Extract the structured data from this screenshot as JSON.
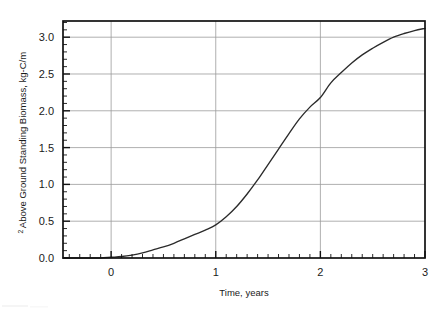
{
  "chart_data": {
    "type": "line",
    "title": "",
    "subtitle": "",
    "xlabel": "Time, years",
    "ylabel": "Above Ground Standing Biomass, kg-C/m²",
    "ylabel_main": "Above Ground Standing Biomass, kg-C/m",
    "ylabel_superscript": "2",
    "xlim": [
      -0.46,
      3.0
    ],
    "ylim": [
      0.0,
      3.22
    ],
    "xticks": [
      0,
      1,
      2,
      3
    ],
    "xtick_labels": [
      "0",
      "1",
      "2",
      "3"
    ],
    "yticks": [
      0.0,
      0.5,
      1.0,
      1.5,
      2.0,
      2.5,
      3.0
    ],
    "ytick_labels": [
      "0.0",
      "0.5",
      "1.0",
      "1.5",
      "2.0",
      "2.5",
      "3.0"
    ],
    "x_minor_step": 0.1,
    "y_minor_step": 0.1,
    "grid": "both",
    "grid_color": "#9a9a9a",
    "line_color": "#2b2b2b",
    "frame_color": "#111111",
    "background_color": "#ffffff",
    "legend": null,
    "legend_position": "none",
    "annotations": [],
    "series": [
      {
        "name": "Above Ground Standing Biomass",
        "x": [
          -0.46,
          -0.3,
          -0.2,
          -0.1,
          0.0,
          0.1,
          0.2,
          0.3,
          0.4,
          0.5,
          0.6,
          0.7,
          0.8,
          0.9,
          1.0,
          1.1,
          1.2,
          1.3,
          1.4,
          1.5,
          1.6,
          1.7,
          1.8,
          1.9,
          2.0,
          2.1,
          2.2,
          2.3,
          2.4,
          2.5,
          2.6,
          2.7,
          2.8,
          2.9,
          3.0
        ],
        "y": [
          0.0,
          0.0,
          0.0,
          0.0,
          0.01,
          0.02,
          0.04,
          0.07,
          0.11,
          0.15,
          0.2,
          0.26,
          0.32,
          0.38,
          0.45,
          0.56,
          0.7,
          0.87,
          1.06,
          1.27,
          1.48,
          1.69,
          1.89,
          2.05,
          2.18,
          2.38,
          2.52,
          2.65,
          2.76,
          2.85,
          2.93,
          3.0,
          3.05,
          3.09,
          3.12
        ]
      }
    ]
  }
}
